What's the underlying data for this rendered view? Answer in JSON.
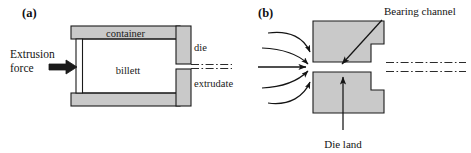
{
  "figure": {
    "type": "technical-diagram",
    "background_color": "#ffffff",
    "metal_fill_color": "#c9c9c9",
    "outline_color": "#1a1a1a",
    "centerline_color": "#2b2b2b"
  },
  "panel_a": {
    "label": "(a)",
    "force_label_line1": "Extrusion",
    "force_label_line2": "force",
    "container_label": "container",
    "billett_label": "billett",
    "die_label": "die",
    "extrudate_label": "extrudate"
  },
  "panel_b": {
    "label": "(b)",
    "bearing_channel_label": "Bearing channel",
    "die_land_label": "Die land",
    "flow_arrow_count": 5
  }
}
